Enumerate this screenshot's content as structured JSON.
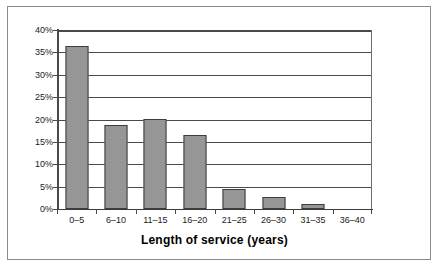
{
  "chart_data": {
    "type": "bar",
    "title": "",
    "xlabel": "Length of service (years)",
    "ylabel": "",
    "categories": [
      "0–5",
      "6–10",
      "11–15",
      "16–20",
      "21–25",
      "26–30",
      "31–35",
      "36–40"
    ],
    "values": [
      36.5,
      18.7,
      20.2,
      16.6,
      4.4,
      2.6,
      1.2,
      0
    ],
    "ylim": [
      0,
      40
    ],
    "ytick_values": [
      0,
      5,
      10,
      15,
      20,
      25,
      30,
      35,
      40
    ],
    "ytick_labels": [
      "0%",
      "5%",
      "10%",
      "15%",
      "20%",
      "25%",
      "30%",
      "35%",
      "40%"
    ],
    "grid": true,
    "legend": false,
    "value_format": "percent"
  },
  "style": {
    "bar_fill": "#969696",
    "bar_border": "#3d3d3d",
    "gridline_color": "#4a4a4a",
    "axis_color": "#4a4a4a",
    "plot_background": "#ffffff",
    "frame_border": "#8c8c8c",
    "text_color": "#1a1a1a"
  }
}
